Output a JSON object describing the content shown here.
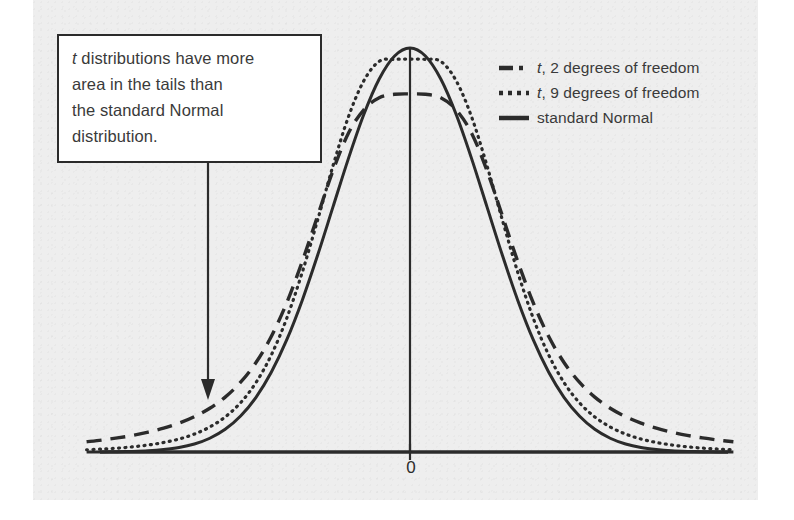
{
  "figure": {
    "background_color": "#eeeeee",
    "ink_color": "#2b2b2b",
    "text_color": "#3a3a3a"
  },
  "callout": {
    "name": "annotation-callout",
    "line1_italic": "t",
    "line1_rest": " distributions have more",
    "line2": "area in the tails than",
    "line3": "the standard Normal",
    "line4": "distribution.",
    "full_text": "t distributions have more area in the tails than the standard Normal distribution."
  },
  "axis": {
    "zero_tick_label": "0"
  },
  "legend": {
    "position": "top-right",
    "items": [
      {
        "key": "t2",
        "style": "dashed",
        "italic_prefix": "t",
        "label_rest": ", 2 degrees of freedom",
        "label": "t, 2 degrees of freedom",
        "color": "#2b2b2b"
      },
      {
        "key": "t9",
        "style": "dotted",
        "italic_prefix": "t",
        "label_rest": ", 9 degrees of freedom",
        "label": "t, 9 degrees of freedom",
        "color": "#2b2b2b"
      },
      {
        "key": "normal",
        "style": "solid",
        "italic_prefix": "",
        "label_rest": "standard Normal",
        "label": "standard Normal",
        "color": "#2b2b2b"
      }
    ]
  },
  "chart_data": {
    "type": "line",
    "title": "",
    "xlabel": "",
    "ylabel": "",
    "xlim": [
      -4.2,
      4.2
    ],
    "ylim": [
      0,
      0.42
    ],
    "grid": false,
    "legend_position": "top-right",
    "xticks": [
      0
    ],
    "xticklabels": [
      "0"
    ],
    "annotations": [
      {
        "text": "t distributions have more area in the tails than the standard Normal distribution.",
        "points_to_series": "t, 2 degrees of freedom",
        "arrow": "down"
      }
    ],
    "x": [
      -4.2,
      -4.0,
      -3.8,
      -3.6,
      -3.4,
      -3.2,
      -3.0,
      -2.8,
      -2.6,
      -2.4,
      -2.2,
      -2.0,
      -1.8,
      -1.6,
      -1.4,
      -1.2,
      -1.0,
      -0.8,
      -0.6,
      -0.4,
      -0.2,
      0.0,
      0.2,
      0.4,
      0.6,
      0.8,
      1.0,
      1.2,
      1.4,
      1.6,
      1.8,
      2.0,
      2.2,
      2.4,
      2.6,
      2.8,
      3.0,
      3.2,
      3.4,
      3.6,
      3.8,
      4.0,
      4.2
    ],
    "series": [
      {
        "name": "t, 2 degrees of freedom",
        "style": "dashed",
        "df": 2,
        "peak": 0.3536,
        "values": [
          0.0101,
          0.0118,
          0.0139,
          0.0164,
          0.0196,
          0.0235,
          0.0285,
          0.0349,
          0.0432,
          0.0542,
          0.0689,
          0.0884,
          0.1142,
          0.1475,
          0.188,
          0.2331,
          0.2778,
          0.3148,
          0.3379,
          0.3498,
          0.3532,
          0.3536,
          0.3532,
          0.3498,
          0.3379,
          0.3148,
          0.2778,
          0.2331,
          0.188,
          0.1475,
          0.1142,
          0.0884,
          0.0689,
          0.0542,
          0.0432,
          0.0349,
          0.0285,
          0.0235,
          0.0196,
          0.0164,
          0.0139,
          0.0118,
          0.0101
        ]
      },
      {
        "name": "t, 9 degrees of freedom",
        "style": "dotted",
        "df": 9,
        "peak": 0.388,
        "values": [
          0.0022,
          0.0029,
          0.0038,
          0.0051,
          0.0069,
          0.0094,
          0.0128,
          0.0177,
          0.0247,
          0.0346,
          0.0487,
          0.0686,
          0.096,
          0.1322,
          0.1773,
          0.229,
          0.2826,
          0.3309,
          0.3665,
          0.3857,
          0.3877,
          0.388,
          0.3877,
          0.3857,
          0.3665,
          0.3309,
          0.2826,
          0.229,
          0.1773,
          0.1322,
          0.096,
          0.0686,
          0.0487,
          0.0346,
          0.0247,
          0.0177,
          0.0128,
          0.0094,
          0.0069,
          0.0051,
          0.0038,
          0.0029,
          0.0022
        ]
      },
      {
        "name": "standard Normal",
        "style": "solid",
        "df": null,
        "peak": 0.3989,
        "values": [
          0.0001,
          0.0001,
          0.0003,
          0.0006,
          0.0012,
          0.0024,
          0.0044,
          0.0079,
          0.0136,
          0.0224,
          0.0355,
          0.054,
          0.079,
          0.1109,
          0.1497,
          0.1942,
          0.242,
          0.2897,
          0.3332,
          0.3683,
          0.391,
          0.3989,
          0.391,
          0.3683,
          0.3332,
          0.2897,
          0.242,
          0.1942,
          0.1497,
          0.1109,
          0.079,
          0.054,
          0.0355,
          0.0224,
          0.0136,
          0.0079,
          0.0044,
          0.0024,
          0.0012,
          0.0006,
          0.0003,
          0.0001,
          0.0001
        ]
      }
    ]
  }
}
